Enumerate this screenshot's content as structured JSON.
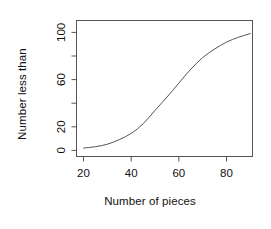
{
  "chart_data": {
    "type": "line",
    "title": "",
    "subtitle": "",
    "xlabel": "Number of pieces",
    "ylabel": "Number less than",
    "xlim": [
      18,
      91
    ],
    "ylim": [
      -3,
      103
    ],
    "xticks": [
      20,
      40,
      60,
      80
    ],
    "yticks": [
      0,
      20,
      40,
      60,
      80,
      100
    ],
    "ytick_labels": [
      "0",
      "20",
      "",
      "60",
      "",
      "100"
    ],
    "xtick_labels": [
      "20",
      "40",
      "60",
      "80"
    ],
    "grid": false,
    "legend": null,
    "legend_position": "none",
    "box": true,
    "series": [
      {
        "name": "Cumulative frequency",
        "color": "#555555",
        "x": [
          20,
          25,
          30,
          35,
          40,
          45,
          50,
          55,
          60,
          65,
          70,
          75,
          80,
          85,
          90
        ],
        "values": [
          2,
          3,
          5,
          9,
          14,
          22,
          34,
          45,
          57,
          69,
          79,
          86,
          92,
          96,
          99
        ]
      }
    ],
    "annotations": []
  },
  "figure": {
    "background": "#ffffff",
    "axis_color": "#555555",
    "text_color": "#111111"
  }
}
